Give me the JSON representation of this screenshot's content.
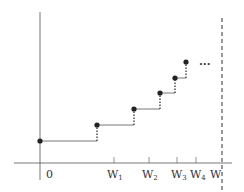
{
  "diagram": {
    "type": "step-function",
    "axis_color": "#555555",
    "line_color": "#444444",
    "dot_color": "#222222",
    "origin_label": "0",
    "x_labels": [
      {
        "main": "W",
        "sub": "1"
      },
      {
        "main": "W",
        "sub": "2"
      },
      {
        "main": "W",
        "sub": "3"
      },
      {
        "main": "W",
        "sub": "4"
      },
      {
        "main": "W",
        "sub": ""
      }
    ],
    "continuation": "...",
    "points": [
      {
        "x": 40,
        "y": 141
      },
      {
        "x": 97,
        "y": 125
      },
      {
        "x": 134,
        "y": 109
      },
      {
        "x": 160,
        "y": 93
      },
      {
        "x": 175,
        "y": 78
      },
      {
        "x": 186,
        "y": 62
      }
    ]
  }
}
